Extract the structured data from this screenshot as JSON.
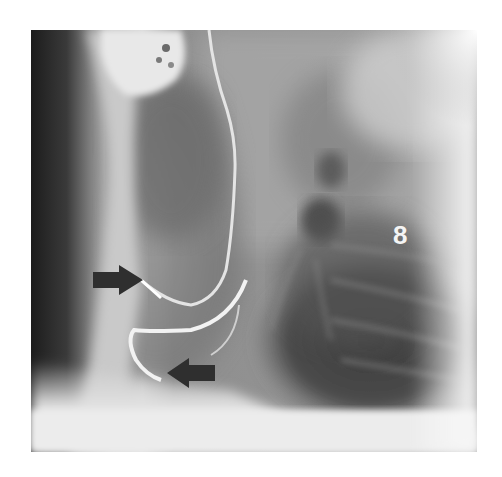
{
  "figure": {
    "type": "lateral chest radiograph",
    "label": "8",
    "annotations": [
      {
        "name": "upper-arrow",
        "direction": "right",
        "target": "catheter tip segment"
      },
      {
        "name": "lower-arrow",
        "direction": "left",
        "target": "curved lead/catheter loop"
      }
    ],
    "colors": {
      "background": "#ffffff",
      "arrow_fill": "#2f2f2f",
      "label_color": "#f4f4f4"
    }
  }
}
